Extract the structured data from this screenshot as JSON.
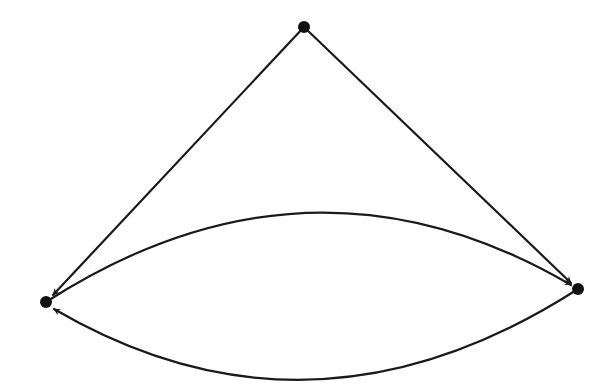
{
  "diagram": {
    "type": "directed-graph",
    "colors": {
      "stroke": "#1a1a1a",
      "node": "#111111",
      "background": "#ffffff"
    },
    "nodes": [
      {
        "id": "top",
        "x": 304,
        "y": 27,
        "r": 6
      },
      {
        "id": "left",
        "x": 46,
        "y": 302,
        "r": 6
      },
      {
        "id": "right",
        "x": 578,
        "y": 289,
        "r": 6
      }
    ],
    "edges": [
      {
        "from": "top",
        "to": "left",
        "shape": "straight"
      },
      {
        "from": "top",
        "to": "right",
        "shape": "straight"
      },
      {
        "from": "left",
        "to": "right",
        "shape": "arc-up",
        "apex_y": 217
      },
      {
        "from": "right",
        "to": "left",
        "shape": "arc-down",
        "bottom_y": 374
      }
    ]
  }
}
